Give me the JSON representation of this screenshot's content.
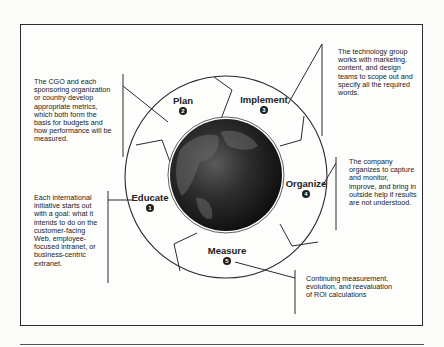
{
  "diagram": {
    "center_image": "globe-image",
    "stages": [
      {
        "label": "Educate",
        "number": "1"
      },
      {
        "label": "Plan",
        "number": "2"
      },
      {
        "label": "Implement",
        "number": "3"
      },
      {
        "label": "Organize",
        "number": "4"
      },
      {
        "label": "Measure",
        "number": "5"
      }
    ],
    "notes": {
      "educate": "Each international initiative starts out with a goal: what it intends to do on the customer-facing Web, employee-focused intranet, or business-centric extranet.",
      "plan": "The CGO and each sponsoring organization or country develop appropriate metrics, which both form the basis for budgets and how performance will be measured.",
      "implement": "The technology group works with marketing, content, and design teams to scope out and specify all the required words.",
      "organize": "The company organizes to capture and monitor, improve, and bring in outside help if results are not understood.",
      "measure": "Continuing measurement, evolution, and reevaluation of ROI calculations"
    }
  }
}
